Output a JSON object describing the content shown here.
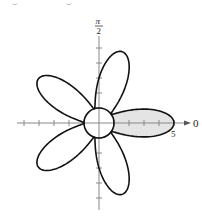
{
  "chart_data": {
    "type": "line",
    "subtype": "polar",
    "title": "",
    "curves": [
      {
        "name": "rose",
        "equation": "r = 3 + 2cos(5θ)",
        "a": 3,
        "b": 2,
        "n": 5,
        "stroke": "#111111"
      },
      {
        "name": "circle",
        "equation": "r = 1",
        "radius": 1,
        "stroke": "#111111",
        "fill": "#ffffff"
      }
    ],
    "shaded_region": {
      "description": "inside petal on polar axis, outside circle",
      "theta_range_deg": [
        -36,
        36
      ],
      "fill": "#e4e4e4"
    },
    "axes": {
      "polar_axis_label": "0",
      "vertical_axis_label": "π/2",
      "tick_label": "5",
      "unit_px": 15,
      "ticks_per_axis": 5,
      "rmax": 5
    },
    "colors": {
      "line": "#111111",
      "shade": "#e4e4e4",
      "axis": "#888888"
    }
  },
  "labels": {
    "zero": "0",
    "pi": "π",
    "two": "2",
    "five": "5"
  }
}
